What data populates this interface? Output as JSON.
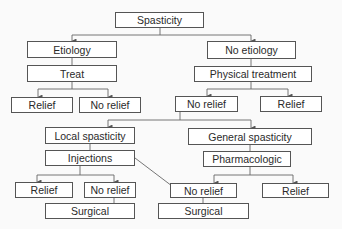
{
  "diagram": {
    "type": "flowchart",
    "title": "Spasticity",
    "nodes": {
      "spasticity": "Spasticity",
      "etiology": "Etiology",
      "treat": "Treat",
      "relief_l1": "Relief",
      "norelief_l1": "No relief",
      "no_etiology": "No etiology",
      "physical_treatment": "Physical treatment",
      "norelief_r1": "No relief",
      "relief_r1": "Relief",
      "local_spasticity": "Local spasticity",
      "injections": "Injections",
      "relief_l2": "Relief",
      "norelief_l2": "No relief",
      "surgical_l2": "Surgical",
      "general_spasticity": "General spasticity",
      "pharmacologic": "Pharmacologic",
      "norelief_r2": "No relief",
      "relief_r2": "Relief",
      "surgical_r2": "Surgical"
    },
    "edges": [
      [
        "spasticity",
        "etiology"
      ],
      [
        "spasticity",
        "no_etiology"
      ],
      [
        "etiology",
        "treat"
      ],
      [
        "treat",
        "relief_l1"
      ],
      [
        "treat",
        "norelief_l1"
      ],
      [
        "no_etiology",
        "physical_treatment"
      ],
      [
        "physical_treatment",
        "norelief_r1"
      ],
      [
        "physical_treatment",
        "relief_r1"
      ],
      [
        "norelief_r1",
        "local_spasticity"
      ],
      [
        "norelief_r1",
        "general_spasticity"
      ],
      [
        "local_spasticity",
        "injections"
      ],
      [
        "injections",
        "relief_l2"
      ],
      [
        "injections",
        "norelief_l2"
      ],
      [
        "injections",
        "norelief_r2"
      ],
      [
        "norelief_l2",
        "surgical_l2"
      ],
      [
        "general_spasticity",
        "pharmacologic"
      ],
      [
        "pharmacologic",
        "norelief_r2"
      ],
      [
        "pharmacologic",
        "relief_r2"
      ],
      [
        "norelief_r2",
        "surgical_r2"
      ]
    ],
    "colors": {
      "line": "#555555",
      "box_fill": "#ffffff",
      "text": "#2a2a2a",
      "background": "#fafafa"
    }
  }
}
